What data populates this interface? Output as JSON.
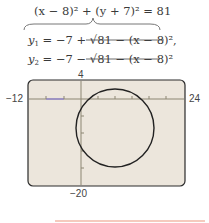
{
  "equations": {
    "circle": "(x − 8)² + (y + 7)² = 81",
    "y1_name": "y",
    "y1_sub": "1",
    "y1_rhs": " = −7 + √81 − (x − 8)²,",
    "y2_name": "y",
    "y2_sub": "2",
    "y2_rhs": " = −7 − √81 − (x − 8)²"
  },
  "window": {
    "xmin": "−12",
    "xmax": "24",
    "ymax": "4",
    "ymin": "−20"
  },
  "graph": {
    "center": [
      8,
      -7
    ],
    "radius": 9,
    "background": "#ece6dc",
    "curve_color": "#222222",
    "axis_color": "#8c8672"
  }
}
